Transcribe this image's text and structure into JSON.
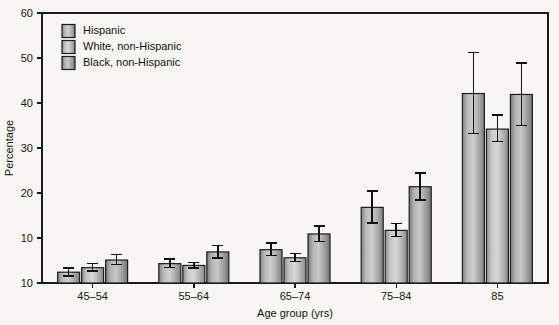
{
  "chart_data": {
    "type": "bar",
    "title": "",
    "subtitle": "",
    "xlabel": "Age group (yrs)",
    "ylabel": "Percentage",
    "categories": [
      "45–54",
      "55–64",
      "65–74",
      "75–84",
      "85"
    ],
    "ylim": [
      0,
      60
    ],
    "yticks": [
      0,
      10,
      20,
      30,
      40,
      50,
      60
    ],
    "ytick_labels": [
      "10",
      "10",
      "20",
      "30",
      "40",
      "50",
      "60"
    ],
    "grid": false,
    "legend_position": "top-left",
    "orientation": "vertical",
    "error_bars": true,
    "series": [
      {
        "name": "Hispanic",
        "color": "#a8a8a8",
        "values": [
          2.4,
          4.3,
          7.4,
          16.8,
          42.1
        ],
        "err_low": [
          1.6,
          3.4,
          6.1,
          13.3,
          33.2
        ],
        "err_high": [
          3.3,
          5.3,
          8.9,
          20.5,
          51.2
        ]
      },
      {
        "name": "White, non-Hispanic",
        "color": "#b5b5b5",
        "values": [
          3.4,
          3.9,
          5.6,
          11.7,
          34.2
        ],
        "err_low": [
          2.7,
          3.3,
          4.8,
          10.3,
          31.4
        ],
        "err_high": [
          4.3,
          4.6,
          6.6,
          13.2,
          37.3
        ]
      },
      {
        "name": "Black, non-Hispanic",
        "color": "#9d9d9d",
        "values": [
          5.1,
          6.9,
          10.9,
          21.4,
          41.9
        ],
        "err_low": [
          4.1,
          5.6,
          9.2,
          18.4,
          35.0
        ],
        "err_high": [
          6.3,
          8.3,
          12.7,
          24.5,
          48.9
        ]
      }
    ]
  },
  "legend": {
    "entries": [
      "Hispanic",
      "White, non-Hispanic",
      "Black, non-Hispanic"
    ]
  }
}
